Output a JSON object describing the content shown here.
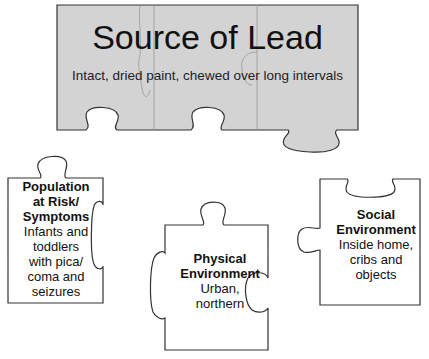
{
  "diagram": {
    "type": "puzzle-pieces",
    "colors": {
      "top_piece_fill": "#d3d3d3",
      "outline": "#333333",
      "background": "#ffffff",
      "seam": "#9a9a9a"
    },
    "source": {
      "title": "Source of Lead",
      "subtitle": "Intact, dried paint, chewed over long intervals"
    },
    "pieces": [
      {
        "heading_lines": [
          "Population",
          "at Risk/",
          "Symptoms"
        ],
        "body_lines": [
          "Infants and",
          "toddlers",
          "with pica/",
          "coma and",
          "seizures"
        ]
      },
      {
        "heading_lines": [
          "Physical",
          "Environment"
        ],
        "body_lines": [
          "Urban,",
          "northern"
        ]
      },
      {
        "heading_lines": [
          "Social",
          "Environment"
        ],
        "body_lines": [
          "Inside home,",
          "cribs and",
          "objects"
        ]
      }
    ]
  }
}
